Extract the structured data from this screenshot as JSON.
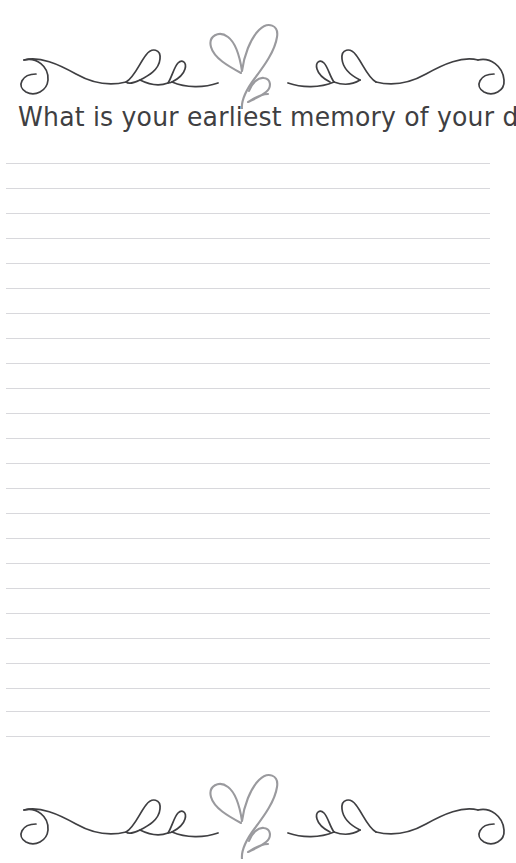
{
  "page": {
    "title": "What is your earliest memory of your dad?",
    "background_color": "#ffffff",
    "width": 516,
    "height": 863,
    "type": "printable-journal-prompt-page"
  },
  "heading": {
    "text": "What is your earliest memory of your dad?",
    "color": "#3f3f42",
    "align": "center"
  },
  "ornament_top": {
    "name": "heart-flourish-divider",
    "description": "Calligraphic swirl divider with two interlocking hearts at center, spiral curls at both ends and decorative loops",
    "swirl_color": "#3f3f42",
    "heart_color": "#9a9a9e",
    "position": "top"
  },
  "ornament_bottom": {
    "name": "heart-flourish-divider",
    "description": "Calligraphic swirl divider with two interlocking hearts at center, spiral curls at both ends and decorative loops",
    "swirl_color": "#3f3f42",
    "heart_color": "#9a9a9e",
    "position": "bottom"
  },
  "writing_area": {
    "line_color": "#d8d8dc",
    "line_count": 24,
    "first_line_y": 163,
    "line_spacing": 25,
    "line_left": 6,
    "line_width": 484,
    "lines": [
      {
        "index": 1,
        "y": 163
      },
      {
        "index": 2,
        "y": 188
      },
      {
        "index": 3,
        "y": 213
      },
      {
        "index": 4,
        "y": 238
      },
      {
        "index": 5,
        "y": 263
      },
      {
        "index": 6,
        "y": 288
      },
      {
        "index": 7,
        "y": 313
      },
      {
        "index": 8,
        "y": 338
      },
      {
        "index": 9,
        "y": 363
      },
      {
        "index": 10,
        "y": 388
      },
      {
        "index": 11,
        "y": 413
      },
      {
        "index": 12,
        "y": 438
      },
      {
        "index": 13,
        "y": 463
      },
      {
        "index": 14,
        "y": 488
      },
      {
        "index": 15,
        "y": 513
      },
      {
        "index": 16,
        "y": 538
      },
      {
        "index": 17,
        "y": 563
      },
      {
        "index": 18,
        "y": 588
      },
      {
        "index": 19,
        "y": 613
      },
      {
        "index": 20,
        "y": 638
      },
      {
        "index": 21,
        "y": 663
      },
      {
        "index": 22,
        "y": 688
      },
      {
        "index": 23,
        "y": 711
      },
      {
        "index": 24,
        "y": 736
      }
    ]
  }
}
